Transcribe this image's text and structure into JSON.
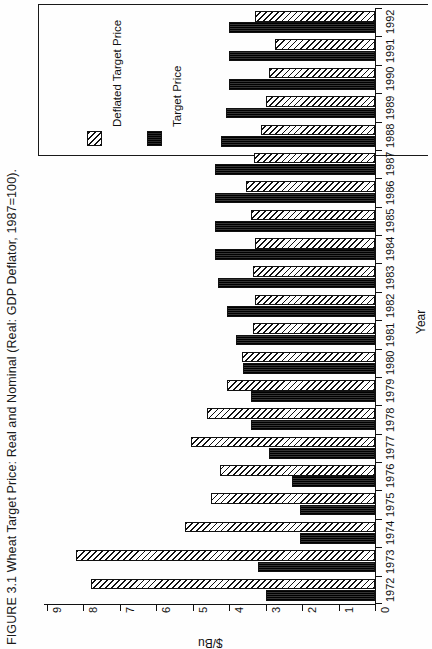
{
  "figure": {
    "title": "FIGURE 3.1  Wheat Target Price: Real and Nominal (Real: GDP Deflator, 1987=100)."
  },
  "legend": {
    "entries": [
      {
        "label": "Deflated Target Price",
        "swatch": "hatched-diagonal",
        "color": "#111111"
      },
      {
        "label": "Target Price",
        "swatch": "solid-black",
        "color": "#1b1b1b"
      }
    ]
  },
  "axes": {
    "value": {
      "title": "$/Bu",
      "ticks": [
        "9",
        "8",
        "7",
        "6",
        "5",
        "4",
        "3",
        "2",
        "1",
        "0"
      ]
    },
    "category": {
      "title": "Year"
    }
  },
  "chart_data": {
    "type": "bar",
    "orientation": "horizontal",
    "title": "FIGURE 3.1  Wheat Target Price: Real and Nominal (Real: GDP Deflator, 1987=100).",
    "xlabel": "$/Bu",
    "ylabel": "Year",
    "xlim": [
      0,
      9
    ],
    "grid": false,
    "legend_position": "top-left",
    "categories": [
      "1972",
      "1973",
      "1974",
      "1975",
      "1976",
      "1977",
      "1978",
      "1979",
      "1980",
      "1981",
      "1982",
      "1983",
      "1984",
      "1985",
      "1986",
      "1987",
      "1988",
      "1989",
      "1990",
      "1991",
      "1992"
    ],
    "series": [
      {
        "name": "Deflated Target Price",
        "values": [
          7.8,
          8.2,
          5.2,
          4.5,
          4.25,
          5.05,
          4.6,
          4.05,
          3.65,
          3.35,
          3.3,
          3.35,
          3.3,
          3.4,
          3.55,
          3.33,
          3.14,
          3.0,
          2.9,
          2.75,
          3.29
        ]
      },
      {
        "name": "Target Price",
        "values": [
          3.0,
          3.2,
          2.05,
          2.05,
          2.29,
          2.9,
          3.4,
          3.4,
          3.63,
          3.81,
          4.05,
          4.3,
          4.38,
          4.38,
          4.38,
          4.38,
          4.23,
          4.1,
          4.0,
          4.0,
          4.0
        ]
      }
    ]
  }
}
